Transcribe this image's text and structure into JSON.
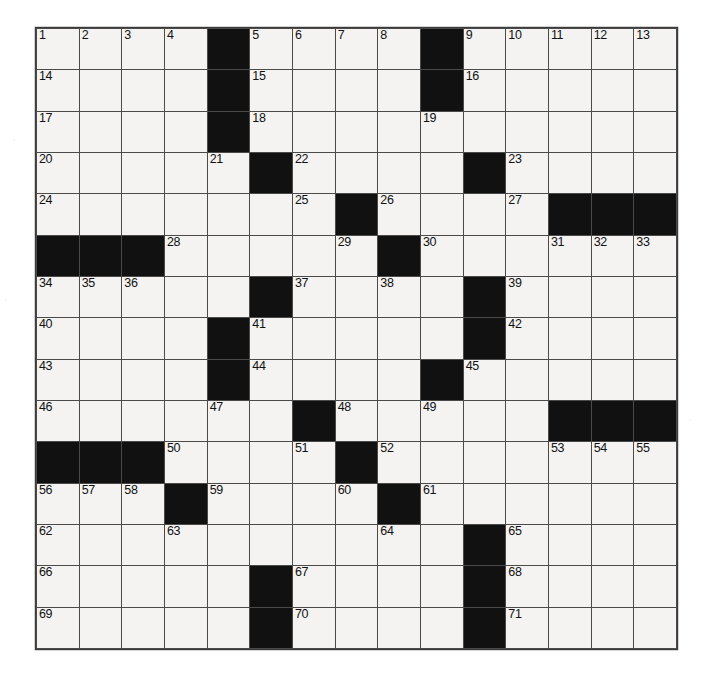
{
  "puzzle": {
    "title": "Crossword Puzzle Grid",
    "size": {
      "rows": 15,
      "cols": 15
    },
    "colors": {
      "block": "#111111",
      "cell": "#f4f3f1",
      "grid_line": "#4a4a4a",
      "number_text": "#111111",
      "page_background": "#ffffff"
    },
    "numbering": {
      "first": 1,
      "last": 71,
      "count": 71
    },
    "across_numbers": [
      1,
      5,
      9,
      14,
      15,
      16,
      17,
      18,
      19,
      20,
      22,
      23,
      24,
      25,
      26,
      27,
      28,
      30,
      34,
      37,
      39,
      40,
      41,
      42,
      43,
      44,
      45,
      46,
      48,
      50,
      52,
      53,
      56,
      59,
      61,
      62,
      64,
      65,
      66,
      67,
      68,
      69,
      70,
      71
    ],
    "down_numbers": [
      1,
      2,
      3,
      4,
      5,
      6,
      7,
      8,
      9,
      10,
      11,
      12,
      13,
      19,
      21,
      23,
      25,
      26,
      27,
      29,
      30,
      31,
      32,
      33,
      34,
      35,
      36,
      37,
      38,
      39,
      41,
      44,
      45,
      47,
      48,
      49,
      50,
      51,
      53,
      54,
      55,
      56,
      57,
      58,
      60,
      63
    ],
    "rows": [
      {
        "index": 0,
        "cells": [
          {
            "block": false,
            "num": "1"
          },
          {
            "block": false,
            "num": "2"
          },
          {
            "block": false,
            "num": "3"
          },
          {
            "block": false,
            "num": "4"
          },
          {
            "block": true,
            "num": ""
          },
          {
            "block": false,
            "num": "5"
          },
          {
            "block": false,
            "num": "6"
          },
          {
            "block": false,
            "num": "7"
          },
          {
            "block": false,
            "num": "8"
          },
          {
            "block": true,
            "num": ""
          },
          {
            "block": false,
            "num": "9"
          },
          {
            "block": false,
            "num": "10"
          },
          {
            "block": false,
            "num": "11"
          },
          {
            "block": false,
            "num": "12"
          },
          {
            "block": false,
            "num": "13"
          }
        ]
      },
      {
        "index": 1,
        "cells": [
          {
            "block": false,
            "num": "14"
          },
          {
            "block": false,
            "num": ""
          },
          {
            "block": false,
            "num": ""
          },
          {
            "block": false,
            "num": ""
          },
          {
            "block": true,
            "num": ""
          },
          {
            "block": false,
            "num": "15"
          },
          {
            "block": false,
            "num": ""
          },
          {
            "block": false,
            "num": ""
          },
          {
            "block": false,
            "num": ""
          },
          {
            "block": true,
            "num": ""
          },
          {
            "block": false,
            "num": "16"
          },
          {
            "block": false,
            "num": ""
          },
          {
            "block": false,
            "num": ""
          },
          {
            "block": false,
            "num": ""
          },
          {
            "block": false,
            "num": ""
          }
        ]
      },
      {
        "index": 2,
        "cells": [
          {
            "block": false,
            "num": "17"
          },
          {
            "block": false,
            "num": ""
          },
          {
            "block": false,
            "num": ""
          },
          {
            "block": false,
            "num": ""
          },
          {
            "block": true,
            "num": ""
          },
          {
            "block": false,
            "num": "18"
          },
          {
            "block": false,
            "num": ""
          },
          {
            "block": false,
            "num": ""
          },
          {
            "block": false,
            "num": ""
          },
          {
            "block": false,
            "num": "19"
          },
          {
            "block": false,
            "num": ""
          },
          {
            "block": false,
            "num": ""
          },
          {
            "block": false,
            "num": ""
          },
          {
            "block": false,
            "num": ""
          },
          {
            "block": false,
            "num": ""
          }
        ]
      },
      {
        "index": 3,
        "cells": [
          {
            "block": false,
            "num": "20"
          },
          {
            "block": false,
            "num": ""
          },
          {
            "block": false,
            "num": ""
          },
          {
            "block": false,
            "num": ""
          },
          {
            "block": false,
            "num": "21"
          },
          {
            "block": true,
            "num": ""
          },
          {
            "block": false,
            "num": "22"
          },
          {
            "block": false,
            "num": ""
          },
          {
            "block": false,
            "num": ""
          },
          {
            "block": false,
            "num": ""
          },
          {
            "block": true,
            "num": ""
          },
          {
            "block": false,
            "num": "23"
          },
          {
            "block": false,
            "num": ""
          },
          {
            "block": false,
            "num": ""
          },
          {
            "block": false,
            "num": ""
          }
        ]
      },
      {
        "index": 4,
        "cells": [
          {
            "block": false,
            "num": "24"
          },
          {
            "block": false,
            "num": ""
          },
          {
            "block": false,
            "num": ""
          },
          {
            "block": false,
            "num": ""
          },
          {
            "block": false,
            "num": ""
          },
          {
            "block": false,
            "num": ""
          },
          {
            "block": false,
            "num": "25"
          },
          {
            "block": true,
            "num": ""
          },
          {
            "block": false,
            "num": "26"
          },
          {
            "block": false,
            "num": ""
          },
          {
            "block": false,
            "num": ""
          },
          {
            "block": false,
            "num": "27"
          },
          {
            "block": true,
            "num": ""
          },
          {
            "block": true,
            "num": ""
          },
          {
            "block": true,
            "num": ""
          }
        ]
      },
      {
        "index": 5,
        "cells": [
          {
            "block": true,
            "num": ""
          },
          {
            "block": true,
            "num": ""
          },
          {
            "block": true,
            "num": ""
          },
          {
            "block": false,
            "num": "28"
          },
          {
            "block": false,
            "num": ""
          },
          {
            "block": false,
            "num": ""
          },
          {
            "block": false,
            "num": ""
          },
          {
            "block": false,
            "num": "29"
          },
          {
            "block": true,
            "num": ""
          },
          {
            "block": false,
            "num": "30"
          },
          {
            "block": false,
            "num": ""
          },
          {
            "block": false,
            "num": ""
          },
          {
            "block": false,
            "num": "31"
          },
          {
            "block": false,
            "num": "32"
          },
          {
            "block": false,
            "num": "33"
          }
        ]
      },
      {
        "index": 6,
        "cells": [
          {
            "block": false,
            "num": "34"
          },
          {
            "block": false,
            "num": "35"
          },
          {
            "block": false,
            "num": "36"
          },
          {
            "block": false,
            "num": ""
          },
          {
            "block": false,
            "num": ""
          },
          {
            "block": true,
            "num": ""
          },
          {
            "block": false,
            "num": "37"
          },
          {
            "block": false,
            "num": ""
          },
          {
            "block": false,
            "num": "38"
          },
          {
            "block": false,
            "num": ""
          },
          {
            "block": true,
            "num": ""
          },
          {
            "block": false,
            "num": "39"
          },
          {
            "block": false,
            "num": ""
          },
          {
            "block": false,
            "num": ""
          },
          {
            "block": false,
            "num": ""
          }
        ]
      },
      {
        "index": 7,
        "cells": [
          {
            "block": false,
            "num": "40"
          },
          {
            "block": false,
            "num": ""
          },
          {
            "block": false,
            "num": ""
          },
          {
            "block": false,
            "num": ""
          },
          {
            "block": true,
            "num": ""
          },
          {
            "block": false,
            "num": "41"
          },
          {
            "block": false,
            "num": ""
          },
          {
            "block": false,
            "num": ""
          },
          {
            "block": false,
            "num": ""
          },
          {
            "block": false,
            "num": ""
          },
          {
            "block": true,
            "num": ""
          },
          {
            "block": false,
            "num": "42"
          },
          {
            "block": false,
            "num": ""
          },
          {
            "block": false,
            "num": ""
          },
          {
            "block": false,
            "num": ""
          }
        ]
      },
      {
        "index": 8,
        "cells": [
          {
            "block": false,
            "num": "43"
          },
          {
            "block": false,
            "num": ""
          },
          {
            "block": false,
            "num": ""
          },
          {
            "block": false,
            "num": ""
          },
          {
            "block": true,
            "num": ""
          },
          {
            "block": false,
            "num": "44"
          },
          {
            "block": false,
            "num": ""
          },
          {
            "block": false,
            "num": ""
          },
          {
            "block": false,
            "num": ""
          },
          {
            "block": true,
            "num": ""
          },
          {
            "block": false,
            "num": "45"
          },
          {
            "block": false,
            "num": ""
          },
          {
            "block": false,
            "num": ""
          },
          {
            "block": false,
            "num": ""
          },
          {
            "block": false,
            "num": ""
          }
        ]
      },
      {
        "index": 9,
        "cells": [
          {
            "block": false,
            "num": "46"
          },
          {
            "block": false,
            "num": ""
          },
          {
            "block": false,
            "num": ""
          },
          {
            "block": false,
            "num": ""
          },
          {
            "block": false,
            "num": "47"
          },
          {
            "block": false,
            "num": ""
          },
          {
            "block": true,
            "num": ""
          },
          {
            "block": false,
            "num": "48"
          },
          {
            "block": false,
            "num": ""
          },
          {
            "block": false,
            "num": "49"
          },
          {
            "block": false,
            "num": ""
          },
          {
            "block": false,
            "num": ""
          },
          {
            "block": true,
            "num": ""
          },
          {
            "block": true,
            "num": ""
          },
          {
            "block": true,
            "num": ""
          }
        ]
      },
      {
        "index": 10,
        "cells": [
          {
            "block": true,
            "num": ""
          },
          {
            "block": true,
            "num": ""
          },
          {
            "block": true,
            "num": ""
          },
          {
            "block": false,
            "num": "50"
          },
          {
            "block": false,
            "num": ""
          },
          {
            "block": false,
            "num": ""
          },
          {
            "block": false,
            "num": "51"
          },
          {
            "block": true,
            "num": ""
          },
          {
            "block": false,
            "num": "52"
          },
          {
            "block": false,
            "num": ""
          },
          {
            "block": false,
            "num": ""
          },
          {
            "block": false,
            "num": ""
          },
          {
            "block": false,
            "num": "53"
          },
          {
            "block": false,
            "num": "54"
          },
          {
            "block": false,
            "num": "55"
          }
        ]
      },
      {
        "index": 11,
        "cells": [
          {
            "block": false,
            "num": "56"
          },
          {
            "block": false,
            "num": "57"
          },
          {
            "block": false,
            "num": "58"
          },
          {
            "block": true,
            "num": ""
          },
          {
            "block": false,
            "num": "59"
          },
          {
            "block": false,
            "num": ""
          },
          {
            "block": false,
            "num": ""
          },
          {
            "block": false,
            "num": "60"
          },
          {
            "block": true,
            "num": ""
          },
          {
            "block": false,
            "num": "61"
          },
          {
            "block": false,
            "num": ""
          },
          {
            "block": false,
            "num": ""
          },
          {
            "block": false,
            "num": ""
          },
          {
            "block": false,
            "num": ""
          },
          {
            "block": false,
            "num": ""
          }
        ]
      },
      {
        "index": 12,
        "cells": [
          {
            "block": false,
            "num": "62"
          },
          {
            "block": false,
            "num": ""
          },
          {
            "block": false,
            "num": ""
          },
          {
            "block": false,
            "num": "63"
          },
          {
            "block": false,
            "num": ""
          },
          {
            "block": false,
            "num": ""
          },
          {
            "block": false,
            "num": ""
          },
          {
            "block": false,
            "num": ""
          },
          {
            "block": false,
            "num": "64"
          },
          {
            "block": false,
            "num": ""
          },
          {
            "block": true,
            "num": ""
          },
          {
            "block": false,
            "num": "65"
          },
          {
            "block": false,
            "num": ""
          },
          {
            "block": false,
            "num": ""
          },
          {
            "block": false,
            "num": ""
          }
        ]
      },
      {
        "index": 13,
        "cells": [
          {
            "block": false,
            "num": "66"
          },
          {
            "block": false,
            "num": ""
          },
          {
            "block": false,
            "num": ""
          },
          {
            "block": false,
            "num": ""
          },
          {
            "block": false,
            "num": ""
          },
          {
            "block": true,
            "num": ""
          },
          {
            "block": false,
            "num": "67"
          },
          {
            "block": false,
            "num": ""
          },
          {
            "block": false,
            "num": ""
          },
          {
            "block": false,
            "num": ""
          },
          {
            "block": true,
            "num": ""
          },
          {
            "block": false,
            "num": "68"
          },
          {
            "block": false,
            "num": ""
          },
          {
            "block": false,
            "num": ""
          },
          {
            "block": false,
            "num": ""
          }
        ]
      },
      {
        "index": 14,
        "cells": [
          {
            "block": false,
            "num": "69"
          },
          {
            "block": false,
            "num": ""
          },
          {
            "block": false,
            "num": ""
          },
          {
            "block": false,
            "num": ""
          },
          {
            "block": false,
            "num": ""
          },
          {
            "block": true,
            "num": ""
          },
          {
            "block": false,
            "num": "70"
          },
          {
            "block": false,
            "num": ""
          },
          {
            "block": false,
            "num": ""
          },
          {
            "block": false,
            "num": ""
          },
          {
            "block": true,
            "num": ""
          },
          {
            "block": false,
            "num": "71"
          },
          {
            "block": false,
            "num": ""
          },
          {
            "block": false,
            "num": ""
          },
          {
            "block": false,
            "num": ""
          }
        ]
      }
    ]
  }
}
